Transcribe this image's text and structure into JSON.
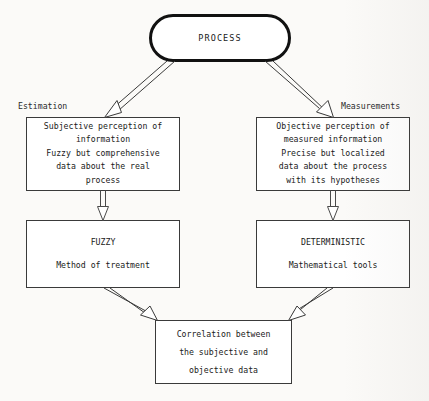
{
  "diagram": {
    "background_color": "#fbfaf8",
    "stroke_color": "#2b2b2b",
    "text_color": "#1a1a1a",
    "captions": {
      "estimation": "Estimation",
      "measurements": "Measurements"
    },
    "nodes": {
      "process": {
        "shape": "rounded-pill",
        "label": "PROCESS",
        "lines": [
          "PROCESS"
        ]
      },
      "left_upper": {
        "shape": "rectangle",
        "lines": [
          "Subjective perception of",
          "information",
          "Fuzzy but comprehensive",
          "data about the real",
          "process"
        ]
      },
      "right_upper": {
        "shape": "rectangle",
        "lines": [
          "Objective perception of",
          "measured information",
          "Precise but localized",
          "data about the process",
          "with its hypotheses"
        ]
      },
      "left_mid": {
        "shape": "rectangle",
        "heading": "FUZZY",
        "body": "Method of treatment"
      },
      "right_mid": {
        "shape": "rectangle",
        "heading": "DETERMINISTIC",
        "body": "Mathematical tools"
      },
      "bottom": {
        "shape": "rectangle",
        "lines": [
          "Correlation between",
          "the subjective and",
          "objective data"
        ]
      }
    },
    "edges": [
      {
        "id": "process-to-left-upper",
        "from": "process",
        "to": "left_upper",
        "style": "hollow-open-arrow"
      },
      {
        "id": "process-to-right-upper",
        "from": "process",
        "to": "right_upper",
        "style": "hollow-open-arrow"
      },
      {
        "id": "left-upper-to-left-mid",
        "from": "left_upper",
        "to": "left_mid",
        "style": "hollow-open-arrow"
      },
      {
        "id": "right-upper-to-right-mid",
        "from": "right_upper",
        "to": "right_mid",
        "style": "hollow-open-arrow"
      },
      {
        "id": "left-mid-to-bottom",
        "from": "left_mid",
        "to": "bottom",
        "style": "hollow-open-arrow"
      },
      {
        "id": "right-mid-to-bottom",
        "from": "right_mid",
        "to": "bottom",
        "style": "hollow-open-arrow"
      }
    ]
  }
}
